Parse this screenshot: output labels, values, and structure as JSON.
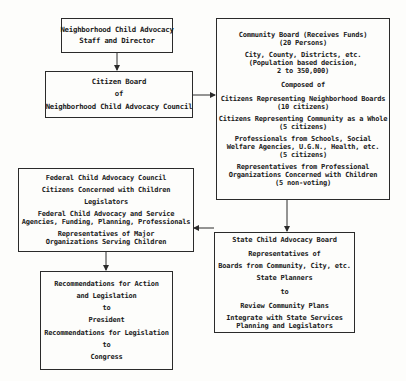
{
  "diagram": {
    "staff_box": {
      "lines": [
        "Neighborhood Child Advocacy",
        "Staff and Director"
      ]
    },
    "citizen_board_box": {
      "lines": [
        "Citizen Board",
        "of",
        "Neighborhood Child Advocacy Council"
      ]
    },
    "community_board_box": {
      "title": [
        "Community Board (Receives Funds)",
        "(20 Persons)"
      ],
      "scope": [
        "City, County, Districts, etc.",
        "(Population based decision,",
        "2 to 350,000)"
      ],
      "composed_of": "Composed of",
      "members": [
        [
          "Citizens Representing Neighborhood Boards",
          "(10 citizens)"
        ],
        [
          "Citizens Representing Community as a Whole",
          "(5 citizens)"
        ],
        [
          "Professionals from Schools, Social",
          "Welfare Agencies, U.G.N., Health, etc.",
          "(5 citizens)"
        ],
        [
          "Representatives from Professional",
          "Organizations Concerned with Children",
          "(5 non-voting)"
        ]
      ]
    },
    "federal_box": {
      "title": "Federal Child Advocacy Council",
      "items": [
        [
          "Citizens Concerned with Children"
        ],
        [
          "Legislators"
        ],
        [
          "Federal Child Advocacy and Service",
          "Agencies, Funding, Planning, Professionals"
        ],
        [
          "Representatives of Major",
          "Organizations Serving Children"
        ]
      ]
    },
    "state_box": {
      "title": "State Child Advocacy Board",
      "lines": [
        "Representatives of",
        "Boards from Community, City, etc.",
        "State Planners",
        "to",
        "Review Community Plans"
      ],
      "last": [
        "Integrate with State Services",
        "Planning and Legislators"
      ]
    },
    "recommendations_box": {
      "lines": [
        "Recommendations for Action",
        "and Legislation",
        "to",
        "President",
        "Recommendations for Legislation",
        "to",
        "Congress"
      ]
    }
  }
}
